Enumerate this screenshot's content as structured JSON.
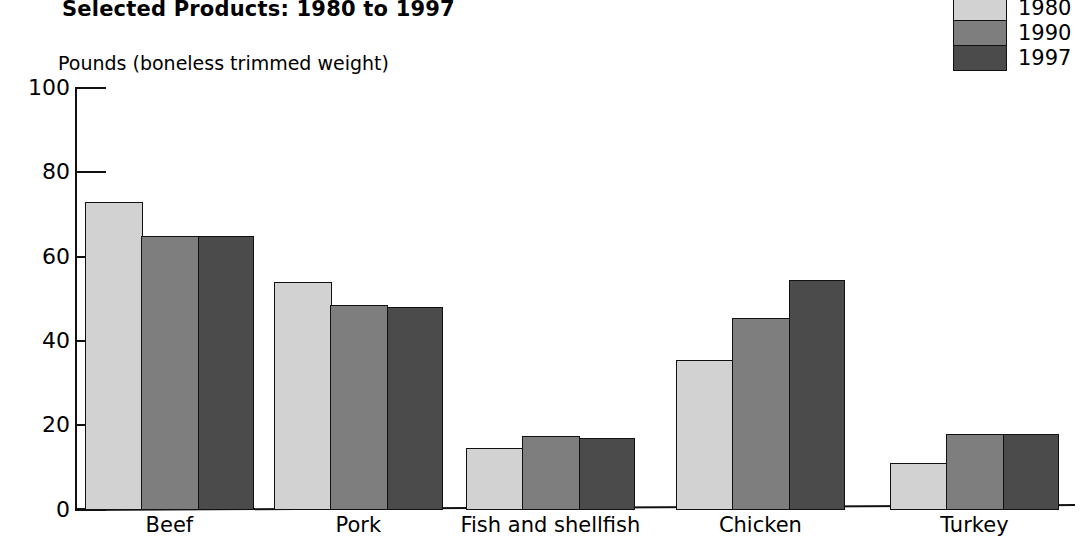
{
  "title": "Selected Products:  1980 to 1997",
  "unit_caption": "Pounds (boneless trimmed weight)",
  "legend": {
    "items": [
      {
        "label": "1980",
        "color": "#d2d2d2"
      },
      {
        "label": "1990",
        "color": "#7e7e7e"
      },
      {
        "label": "1997",
        "color": "#4b4b4b"
      }
    ]
  },
  "chart_data": {
    "type": "bar",
    "title": "Selected Products:  1980 to 1997",
    "xlabel": "",
    "ylabel": "Pounds (boneless trimmed weight)",
    "ylim": [
      0,
      100
    ],
    "yticks": [
      "0",
      "20",
      "40",
      "60",
      "80",
      "100"
    ],
    "ytick_values": [
      0,
      20,
      40,
      60,
      80,
      100
    ],
    "grid": false,
    "legend_position": "top-right",
    "categories": [
      "Beef",
      "Pork",
      "Fish and shellfish",
      "Chicken",
      "Turkey"
    ],
    "series": [
      {
        "name": "1980",
        "color": "#d2d2d2",
        "values": [
          73,
          54,
          14.5,
          35.5,
          11
        ]
      },
      {
        "name": "1990",
        "color": "#7e7e7e",
        "values": [
          65,
          48.5,
          17.5,
          45.5,
          18
        ]
      },
      {
        "name": "1997",
        "color": "#4b4b4b",
        "values": [
          65,
          48,
          17,
          54.5,
          18
        ]
      }
    ]
  }
}
